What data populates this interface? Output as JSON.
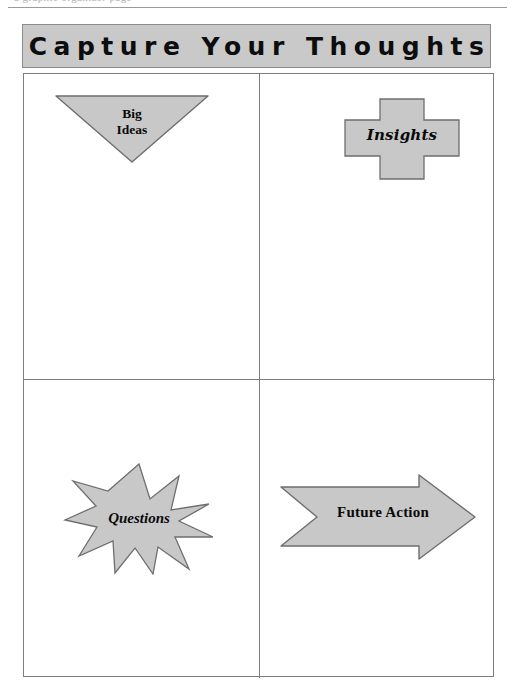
{
  "page": {
    "top_cropped_text": "a graphic organizer page",
    "background_color": "#ffffff"
  },
  "header": {
    "title": "Capture Your Thoughts",
    "background_color": "#c9c9c9",
    "border_color": "#8c8c8c",
    "text_color": "#0d0d0d"
  },
  "grid": {
    "border_color": "#7d7d7d",
    "columns": 2,
    "rows": 2
  },
  "shape_style": {
    "fill": "#c8c8c8",
    "stroke": "#6e6e6e",
    "text_color": "#0a0a0a"
  },
  "quadrants": [
    {
      "position": "top-left",
      "shape": "inverted-triangle",
      "label": "Big\nIdeas"
    },
    {
      "position": "top-right",
      "shape": "cross",
      "label": "Insights"
    },
    {
      "position": "bottom-left",
      "shape": "ten-point-star",
      "label": "Questions"
    },
    {
      "position": "bottom-right",
      "shape": "right-arrow",
      "label": "Future Action"
    }
  ]
}
